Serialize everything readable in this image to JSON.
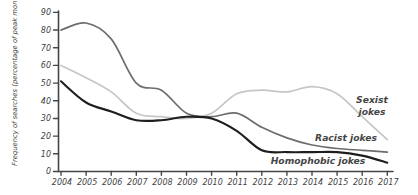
{
  "figure": {
    "background": "#ffffff",
    "axis_color": "#454545",
    "tick_text_color": "#3f3f3f"
  },
  "chart_data": {
    "type": "line",
    "title": "",
    "xlabel": "",
    "ylabel": "Frequency of searches (percentage of peak month)",
    "ylim": [
      0,
      90
    ],
    "yticks": [
      0,
      10,
      20,
      30,
      40,
      50,
      60,
      70,
      80,
      90
    ],
    "grid": false,
    "legend_position": "inline-labels-right",
    "x": [
      2004,
      2005,
      2006,
      2007,
      2008,
      2009,
      2010,
      2011,
      2012,
      2013,
      2014,
      2015,
      2016,
      2017
    ],
    "series": [
      {
        "name": "Sexist jokes",
        "color": "#c6c6c4",
        "values": [
          60,
          53,
          45,
          33,
          31,
          30,
          33,
          44,
          46,
          45,
          48,
          44,
          31,
          18
        ]
      },
      {
        "name": "Racist jokes",
        "color": "#6d6d6b",
        "values": [
          80,
          84,
          75,
          50,
          46,
          33,
          31,
          33,
          25,
          19,
          15,
          13,
          12,
          11
        ]
      },
      {
        "name": "Homophobic jokes",
        "color": "#1e1e1c",
        "values": [
          51,
          39,
          34,
          29,
          29,
          31,
          30,
          23,
          12,
          11,
          11,
          11,
          9,
          5
        ]
      }
    ],
    "annotations": [
      {
        "series": "Sexist jokes",
        "lines": [
          "Sexist",
          "jokes"
        ]
      },
      {
        "series": "Racist jokes",
        "lines": [
          "Racist jokes"
        ]
      },
      {
        "series": "Homophobic jokes",
        "lines": [
          "Homophobic jokes"
        ]
      }
    ]
  }
}
